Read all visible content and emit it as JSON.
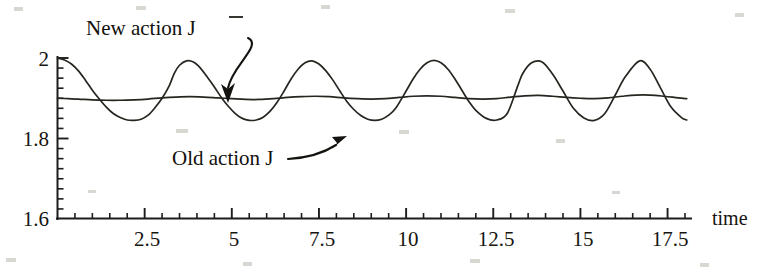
{
  "figure": {
    "name": "action-comparison-plot",
    "background_color": "#ffffff",
    "ink_color": "#1d1d1d"
  },
  "chart_data": {
    "type": "line",
    "title": "",
    "subtitle": "",
    "xlabel": "time",
    "ylabel": "",
    "xlim": [
      0,
      18
    ],
    "ylim": [
      1.6,
      2.0
    ],
    "grid": false,
    "legend": "none",
    "x_ticks_major": [
      2.5,
      5,
      7.5,
      10,
      12.5,
      15,
      17.5
    ],
    "x_tick_labels": [
      "2.5",
      "5",
      "7.5",
      "10",
      "12.5",
      "15",
      "17.5"
    ],
    "x_tick_minor_step": 0.5,
    "y_ticks_major": [
      1.6,
      1.8,
      2
    ],
    "y_tick_labels": [
      "1.6",
      "1.8",
      "2"
    ],
    "y_tick_minor_step": 0.025,
    "annotations": [
      {
        "id": "new-action-annotation",
        "text": "New action J̅",
        "text_plain": "New action J",
        "accent": "overbar",
        "points_to_series": "New action J-bar",
        "label_x": 2.5,
        "label_y": 1.995
      },
      {
        "id": "old-action-annotation",
        "text": "Old action J",
        "points_to_series": "Old action J",
        "label_x": 5.3,
        "label_y": 1.755
      }
    ],
    "series": [
      {
        "name": "Old action J",
        "style": "solid",
        "color": "#26251f",
        "description": "Large sustained oscillation, period ~3.33, starting at 2.0 and settling between ~1.845 and ~1.995",
        "x": [
          0,
          0.2,
          0.4,
          0.6,
          0.8,
          1,
          1.2,
          1.4,
          1.6,
          1.8,
          2,
          2.2,
          2.4,
          2.6,
          2.8,
          3,
          3.2,
          3.35,
          3.5,
          3.7,
          3.9,
          4.1,
          4.3,
          4.5,
          4.7,
          4.9,
          5.1,
          5.3,
          5.5,
          5.7,
          5.9,
          6.1,
          6.3,
          6.5,
          6.7,
          6.9,
          7.1,
          7.3,
          7.5,
          7.7,
          7.9,
          8.1,
          8.3,
          8.5,
          8.7,
          8.9,
          9.1,
          9.3,
          9.5,
          9.7,
          10,
          10.2,
          10.4,
          10.6,
          10.8,
          11,
          11.2,
          11.4,
          11.6,
          11.8,
          12,
          12.3,
          12.6,
          12.9,
          13.2,
          13.35,
          13.6,
          13.9,
          14.2,
          14.5,
          14.8,
          15.1,
          15.4,
          15.7,
          16,
          16.3,
          16.7,
          17,
          17.3,
          17.6,
          17.9,
          18.05
        ],
        "y": [
          2.0,
          1.995,
          1.985,
          1.968,
          1.945,
          1.92,
          1.898,
          1.878,
          1.862,
          1.852,
          1.846,
          1.845,
          1.848,
          1.858,
          1.877,
          1.9,
          1.93,
          1.962,
          1.982,
          1.993,
          1.99,
          1.975,
          1.952,
          1.928,
          1.902,
          1.88,
          1.862,
          1.85,
          1.845,
          1.846,
          1.853,
          1.868,
          1.89,
          1.918,
          1.948,
          1.972,
          1.988,
          1.993,
          1.985,
          1.968,
          1.945,
          1.918,
          1.892,
          1.872,
          1.857,
          1.848,
          1.845,
          1.848,
          1.858,
          1.875,
          1.918,
          1.948,
          1.972,
          1.988,
          1.994,
          1.988,
          1.972,
          1.948,
          1.92,
          1.892,
          1.87,
          1.85,
          1.846,
          1.862,
          1.93,
          1.962,
          1.988,
          1.99,
          1.96,
          1.918,
          1.875,
          1.851,
          1.845,
          1.862,
          1.908,
          1.955,
          1.993,
          1.972,
          1.925,
          1.878,
          1.852,
          1.846
        ]
      },
      {
        "name": "New action J-bar",
        "style": "solid",
        "color": "#26251f",
        "description": "Nearly flat curve with very small ripple about 1.90",
        "x": [
          0,
          0.3,
          0.6,
          1,
          1.4,
          1.8,
          2.2,
          2.6,
          3,
          3.4,
          3.8,
          4.2,
          4.6,
          5,
          5.4,
          5.8,
          6.2,
          6.6,
          7,
          7.4,
          7.8,
          8.2,
          8.6,
          9,
          9.4,
          9.8,
          10.2,
          10.6,
          11,
          11.4,
          11.8,
          12.2,
          12.6,
          13,
          13.4,
          13.8,
          14.2,
          14.6,
          15,
          15.4,
          15.8,
          16.2,
          16.6,
          17,
          17.4,
          17.8,
          18.05
        ],
        "y": [
          1.9,
          1.899,
          1.898,
          1.896,
          1.895,
          1.895,
          1.896,
          1.898,
          1.901,
          1.903,
          1.904,
          1.903,
          1.901,
          1.899,
          1.897,
          1.897,
          1.899,
          1.902,
          1.904,
          1.905,
          1.904,
          1.901,
          1.899,
          1.898,
          1.899,
          1.902,
          1.905,
          1.906,
          1.905,
          1.902,
          1.899,
          1.898,
          1.899,
          1.903,
          1.906,
          1.907,
          1.905,
          1.902,
          1.9,
          1.899,
          1.901,
          1.905,
          1.908,
          1.908,
          1.905,
          1.901,
          1.899
        ]
      }
    ]
  }
}
